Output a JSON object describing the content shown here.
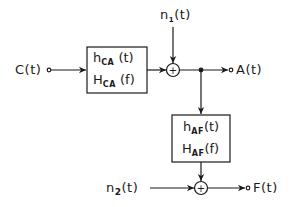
{
  "diagram": {
    "type": "block_diagram",
    "inputs": {
      "c": {
        "name": "C",
        "arg": "(t)"
      },
      "n1": {
        "name": "n",
        "sub": "1",
        "arg": "(t)"
      },
      "n2": {
        "name": "n",
        "sub": "2",
        "arg": "(t)"
      }
    },
    "outputs": {
      "a": {
        "name": "A",
        "arg": "(t)"
      },
      "f": {
        "name": "F",
        "arg": "(t)"
      }
    },
    "blocks": [
      {
        "id": "ca",
        "line1": {
          "name": "h",
          "sub": "CA",
          "arg": "(t)"
        },
        "line2": {
          "name": "H",
          "sub": "CA",
          "arg": "(f)"
        }
      },
      {
        "id": "af",
        "line1": {
          "name": "h",
          "sub": "AF",
          "arg": "(t)"
        },
        "line2": {
          "name": "H",
          "sub": "AF",
          "arg": "(f)"
        }
      }
    ],
    "summers": [
      {
        "id": "sum1",
        "symbol": "+"
      },
      {
        "id": "sum2",
        "symbol": "+"
      }
    ],
    "connections": [
      "C(t) -> h_CA",
      "h_CA -> sum1",
      "n1(t) -> sum1",
      "sum1 -> A(t)",
      "sum1 -> h_AF",
      "h_AF -> sum2",
      "n2(t) -> sum2",
      "sum2 -> F(t)"
    ]
  }
}
